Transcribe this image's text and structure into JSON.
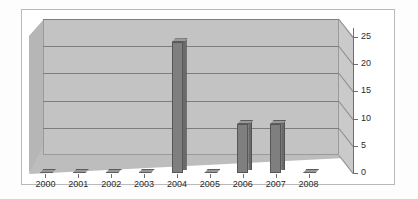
{
  "chart_data": {
    "type": "bar",
    "title": "",
    "subtitle": "",
    "xlabel": "",
    "ylabel": "",
    "categories": [
      "2000",
      "2001",
      "2002",
      "2003",
      "2004",
      "2005",
      "2006",
      "2007",
      "2008"
    ],
    "values": [
      0,
      0,
      0,
      0,
      24,
      0,
      9,
      9,
      0
    ],
    "series": [
      {
        "name": "Series 1",
        "values": [
          0,
          0,
          0,
          0,
          24,
          0,
          9,
          9,
          0
        ]
      }
    ],
    "ylim": [
      0,
      25
    ],
    "ytick_values": [
      0,
      5,
      10,
      15,
      20,
      25
    ],
    "ytick_labels": [
      "0",
      "5",
      "10",
      "15",
      "20",
      "25"
    ],
    "grid": true,
    "grid_axis": "y",
    "legend": false,
    "legend_position": "none",
    "three_d": true,
    "annotations": []
  },
  "style": {
    "plot_background": "#c3c3c3",
    "floor_color": "#bdbdbd",
    "left_wall_color": "#b6b6b6",
    "right_wall_color": "#cacaca",
    "gridline_color": "#7d7d7d",
    "bar_front_color": "#7f7f7f",
    "bar_side_color": "#6a6a6a",
    "bar_top_color": "#989898",
    "axis_color": "#6e6e6e",
    "text_color": "#2b2b2b",
    "frame_color": "#b9b9b9",
    "page_background": "#ffffff"
  }
}
